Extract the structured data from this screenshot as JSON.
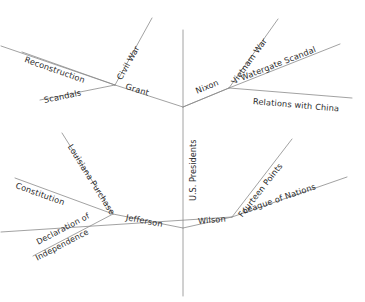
{
  "diagram": {
    "type": "mind-map",
    "title": "U.S. Presidents",
    "trunk": {
      "label": "U.S. Presidents",
      "orientation": "vertical",
      "text_rotation_deg": -90
    },
    "style": {
      "line_color": "#8a8a8a",
      "text_color": "#2b2b2b",
      "background": "#ffffff",
      "line_width": 0.8
    },
    "nodes": [
      {
        "id": "grant",
        "label": "Grant",
        "quadrant": "upper-left",
        "branches": [
          {
            "id": "civil-war",
            "label": "Civil War"
          },
          {
            "id": "reconstruction",
            "label": "Reconstruction"
          },
          {
            "id": "scandals",
            "label": "Scandals"
          }
        ]
      },
      {
        "id": "nixon",
        "label": "Nixon",
        "quadrant": "upper-right",
        "branches": [
          {
            "id": "vietnam-war",
            "label": "Vietnam War"
          },
          {
            "id": "watergate-scandal",
            "label": "Watergate Scandal"
          },
          {
            "id": "relations-with-china",
            "label": "Relations with China"
          }
        ]
      },
      {
        "id": "jefferson",
        "label": "Jefferson",
        "quadrant": "lower-left",
        "branches": [
          {
            "id": "louisiana-purchase",
            "label": "Louisiana Purchase"
          },
          {
            "id": "constitution",
            "label": "Constitution"
          },
          {
            "id": "declaration-line-1",
            "label": "Declaration of"
          },
          {
            "id": "declaration-line-2",
            "label": "Independence"
          }
        ]
      },
      {
        "id": "wilson",
        "label": "Wilson",
        "quadrant": "lower-right",
        "branches": [
          {
            "id": "fourteen-points",
            "label": "Fourteen Points"
          },
          {
            "id": "league-of-nations",
            "label": "League of Nations"
          }
        ]
      }
    ]
  }
}
